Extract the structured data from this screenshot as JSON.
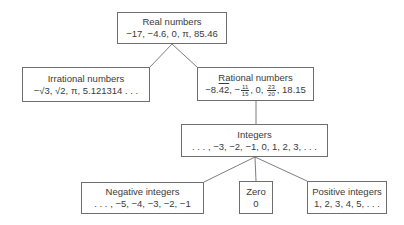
{
  "diagram": {
    "type": "hierarchy-tree",
    "nodes": {
      "real": {
        "title": "Real numbers",
        "examples": "−17, −4.6, 0, π, 85.46"
      },
      "irrational": {
        "title": "Irrational numbers",
        "examples": "−√3, √2, π, 5.121314 . . ."
      },
      "rational": {
        "title": "Rational numbers",
        "ex_part1": "−8.",
        "ex_repeat": "42",
        "ex_part2": ", −",
        "frac1_num": "11",
        "frac1_den": "15",
        "ex_part3": ", 0, ",
        "frac2_num": "23",
        "frac2_den": "20",
        "ex_part4": ", 18.15"
      },
      "integers": {
        "title": "Integers",
        "examples": ". . . , −3, −2, −1, 0, 1, 2, 3, . . ."
      },
      "negative": {
        "title": "Negative integers",
        "examples": ". . . , −5, −4, −3, −2, −1"
      },
      "zero": {
        "title": "Zero",
        "examples": "0"
      },
      "positive": {
        "title": "Positive integers",
        "examples": "1, 2, 3, 4, 5, . . ."
      }
    },
    "edges": [
      [
        "real",
        "irrational"
      ],
      [
        "real",
        "rational"
      ],
      [
        "rational",
        "integers"
      ],
      [
        "integers",
        "negative"
      ],
      [
        "integers",
        "zero"
      ],
      [
        "integers",
        "positive"
      ]
    ],
    "colors": {
      "line": "#6e6e6e",
      "text": "#3a3a3a",
      "background": "#ffffff"
    }
  }
}
